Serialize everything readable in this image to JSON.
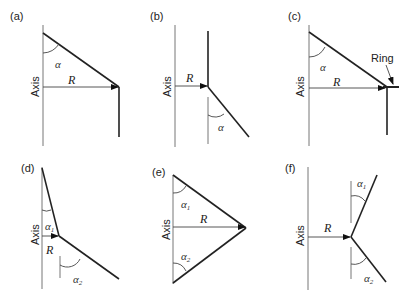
{
  "figure": {
    "panels": [
      {
        "id": "a",
        "label": "(a)",
        "axis_label": "Axis",
        "radius_label": "R",
        "angles": [
          "α"
        ]
      },
      {
        "id": "b",
        "label": "(b)",
        "axis_label": "Axis",
        "radius_label": "R",
        "angles": [
          "α"
        ]
      },
      {
        "id": "c",
        "label": "(c)",
        "axis_label": "Axis",
        "radius_label": "R",
        "angles": [
          "α"
        ],
        "annotation": "Ring"
      },
      {
        "id": "d",
        "label": "(d)",
        "axis_label": "Axis",
        "radius_label": "R",
        "angles": [
          "α",
          "α"
        ],
        "angle_subs": [
          "1",
          "2"
        ]
      },
      {
        "id": "e",
        "label": "(e)",
        "axis_label": "Axis",
        "radius_label": "R",
        "angles": [
          "α",
          "α"
        ],
        "angle_subs": [
          "1",
          "2"
        ]
      },
      {
        "id": "f",
        "label": "(f)",
        "axis_label": "Axis",
        "radius_label": "R",
        "angles": [
          "α",
          "α"
        ],
        "angle_subs": [
          "1",
          "2"
        ]
      }
    ]
  },
  "colors": {
    "line": "#222222",
    "axis": "#777777",
    "background": "#ffffff"
  }
}
